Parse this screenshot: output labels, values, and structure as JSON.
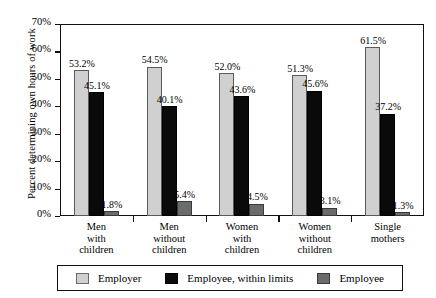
{
  "top_caption": "",
  "chart_data": {
    "type": "bar",
    "title": "",
    "xlabel": "",
    "ylabel": "Percent determining own hours of work",
    "ylim": [
      0,
      70
    ],
    "ytick_values": [
      70,
      60,
      50,
      40,
      30,
      20,
      10,
      0
    ],
    "ytick_labels": [
      "70%",
      "60%",
      "50%",
      "40%",
      "30%",
      "20%",
      "10%",
      "0%"
    ],
    "grid": false,
    "legend_position": "bottom",
    "categories": [
      "Men with children",
      "Men without children",
      "Women with children",
      "Women without children",
      "Single mothers"
    ],
    "category_lines": [
      [
        "Men",
        "with",
        "children"
      ],
      [
        "Men",
        "without",
        "children"
      ],
      [
        "Women",
        "with",
        "children"
      ],
      [
        "Women",
        "without",
        "children"
      ],
      [
        "Single",
        "mothers"
      ]
    ],
    "series": [
      {
        "name": "Employer",
        "color": "#d0d0d0",
        "values": [
          53.2,
          54.5,
          52.0,
          51.3,
          61.5
        ],
        "labels": [
          "53.2%",
          "54.5%",
          "52.0%",
          "51.3%",
          "61.5%"
        ]
      },
      {
        "name": "Employee, within limits",
        "color": "#0a0a0a",
        "values": [
          45.1,
          40.1,
          43.6,
          45.6,
          37.2
        ],
        "labels": [
          "45.1%",
          "40.1%",
          "43.6%",
          "45.6%",
          "37.2%"
        ]
      },
      {
        "name": "Employee",
        "color": "#6b6b6b",
        "values": [
          1.8,
          5.4,
          4.5,
          3.1,
          1.3
        ],
        "labels": [
          "1.8%",
          "5.4%",
          "4.5%",
          "3.1%",
          "1.3%"
        ]
      }
    ]
  }
}
